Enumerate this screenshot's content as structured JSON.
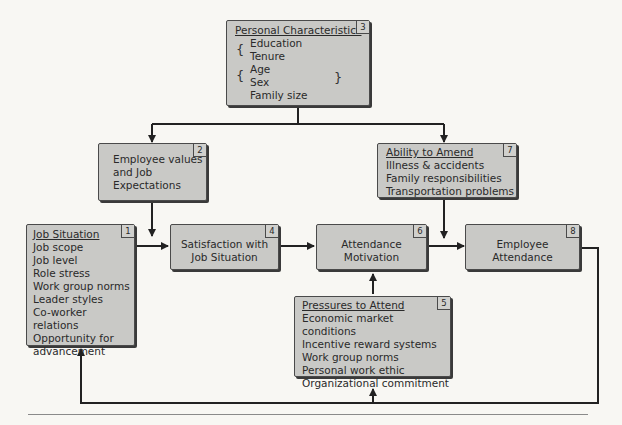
{
  "diagram": {
    "nodes": [
      {
        "id": 1,
        "number": "1",
        "title": "Job Situation",
        "items": [
          "Job scope",
          "Job level",
          "Role stress",
          "Work group norms",
          "Leader styles",
          "Co-worker relations",
          "Opportunity for",
          "advancement"
        ]
      },
      {
        "id": 2,
        "number": "2",
        "lines": [
          "Employee values",
          "and Job",
          "Expectations"
        ]
      },
      {
        "id": 3,
        "number": "3",
        "title": "Personal Characteristics",
        "items": [
          "Education",
          "Tenure",
          "Age",
          "Sex",
          "Family size"
        ]
      },
      {
        "id": 4,
        "number": "4",
        "lines": [
          "Satisfaction with",
          "Job Situation"
        ]
      },
      {
        "id": 5,
        "number": "5",
        "title": "Pressures to Attend",
        "items": [
          "Economic market conditions",
          "Incentive reward systems",
          "Work group norms",
          "Personal work ethic",
          "Organizational commitment"
        ]
      },
      {
        "id": 6,
        "number": "6",
        "lines": [
          "Attendance",
          "Motivation"
        ]
      },
      {
        "id": 7,
        "number": "7",
        "title": "Ability to Amend",
        "items": [
          "Illness & accidents",
          "Family responsibilities",
          "Transportation problems"
        ]
      },
      {
        "id": 8,
        "number": "8",
        "lines": [
          "Employee",
          "Attendance"
        ]
      }
    ],
    "edges": [
      {
        "from": 3,
        "to": 2
      },
      {
        "from": 3,
        "to": 7
      },
      {
        "from": 2,
        "to": 4
      },
      {
        "from": 1,
        "to": 4
      },
      {
        "from": 4,
        "to": 6
      },
      {
        "from": 5,
        "to": 6
      },
      {
        "from": 6,
        "to": 8
      },
      {
        "from": 7,
        "to": 8
      },
      {
        "from": 8,
        "to": 1,
        "type": "feedback"
      },
      {
        "from": 8,
        "to": 5,
        "type": "feedback"
      }
    ]
  }
}
